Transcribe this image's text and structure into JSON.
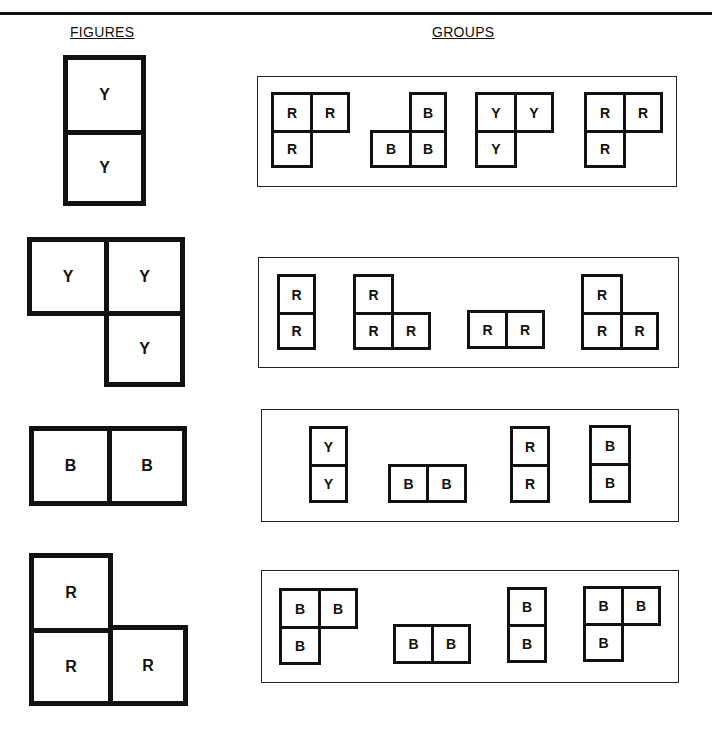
{
  "headings": {
    "figures": "FIGURES",
    "groups": "GROUPS"
  },
  "figures": [
    {
      "cells": [
        {
          "label": "Y",
          "x": 63,
          "y": 55,
          "w": 83,
          "h": 80
        },
        {
          "label": "Y",
          "x": 63,
          "y": 130,
          "w": 83,
          "h": 76
        }
      ]
    },
    {
      "cells": [
        {
          "label": "Y",
          "x": 27,
          "y": 237,
          "w": 82,
          "h": 79
        },
        {
          "label": "Y",
          "x": 104,
          "y": 237,
          "w": 81,
          "h": 79
        },
        {
          "label": "Y",
          "x": 104,
          "y": 311,
          "w": 81,
          "h": 76
        }
      ]
    },
    {
      "cells": [
        {
          "label": "B",
          "x": 29,
          "y": 426,
          "w": 83,
          "h": 80
        },
        {
          "label": "B",
          "x": 107,
          "y": 426,
          "w": 80,
          "h": 80
        }
      ]
    },
    {
      "cells": [
        {
          "label": "R",
          "x": 29,
          "y": 553,
          "w": 84,
          "h": 80
        },
        {
          "label": "R",
          "x": 29,
          "y": 628,
          "w": 84,
          "h": 78
        },
        {
          "label": "R",
          "x": 108,
          "y": 625,
          "w": 80,
          "h": 81
        }
      ]
    }
  ],
  "groups": [
    {
      "box": {
        "x": 257,
        "y": 76,
        "w": 420,
        "h": 111
      },
      "shapes": [
        {
          "cells": [
            {
              "label": "R",
              "x": 271,
              "y": 92,
              "w": 42,
              "h": 41
            },
            {
              "label": "R",
              "x": 310,
              "y": 92,
              "w": 40,
              "h": 41
            },
            {
              "label": "R",
              "x": 271,
              "y": 130,
              "w": 42,
              "h": 38
            }
          ]
        },
        {
          "cells": [
            {
              "label": "B",
              "x": 409,
              "y": 92,
              "w": 38,
              "h": 41
            },
            {
              "label": "B",
              "x": 370,
              "y": 130,
              "w": 42,
              "h": 38
            },
            {
              "label": "B",
              "x": 409,
              "y": 130,
              "w": 38,
              "h": 38
            }
          ]
        },
        {
          "cells": [
            {
              "label": "Y",
              "x": 475,
              "y": 92,
              "w": 42,
              "h": 41
            },
            {
              "label": "Y",
              "x": 514,
              "y": 92,
              "w": 40,
              "h": 41
            },
            {
              "label": "Y",
              "x": 475,
              "y": 130,
              "w": 42,
              "h": 38
            }
          ]
        },
        {
          "cells": [
            {
              "label": "R",
              "x": 584,
              "y": 92,
              "w": 42,
              "h": 41
            },
            {
              "label": "R",
              "x": 623,
              "y": 92,
              "w": 40,
              "h": 41
            },
            {
              "label": "R",
              "x": 584,
              "y": 130,
              "w": 42,
              "h": 38
            }
          ]
        }
      ]
    },
    {
      "box": {
        "x": 258,
        "y": 257,
        "w": 421,
        "h": 111
      },
      "shapes": [
        {
          "cells": [
            {
              "label": "R",
              "x": 277,
              "y": 274,
              "w": 39,
              "h": 41
            },
            {
              "label": "R",
              "x": 277,
              "y": 312,
              "w": 39,
              "h": 38
            }
          ]
        },
        {
          "cells": [
            {
              "label": "R",
              "x": 353,
              "y": 274,
              "w": 41,
              "h": 41
            },
            {
              "label": "R",
              "x": 353,
              "y": 312,
              "w": 41,
              "h": 38
            },
            {
              "label": "R",
              "x": 391,
              "y": 312,
              "w": 40,
              "h": 38
            }
          ]
        },
        {
          "cells": [
            {
              "label": "R",
              "x": 467,
              "y": 310,
              "w": 41,
              "h": 39
            },
            {
              "label": "R",
              "x": 505,
              "y": 310,
              "w": 40,
              "h": 39
            }
          ]
        },
        {
          "cells": [
            {
              "label": "R",
              "x": 581,
              "y": 274,
              "w": 42,
              "h": 41
            },
            {
              "label": "R",
              "x": 581,
              "y": 312,
              "w": 42,
              "h": 38
            },
            {
              "label": "R",
              "x": 620,
              "y": 312,
              "w": 39,
              "h": 38
            }
          ]
        }
      ]
    },
    {
      "box": {
        "x": 261,
        "y": 409,
        "w": 418,
        "h": 113
      },
      "shapes": [
        {
          "cells": [
            {
              "label": "Y",
              "x": 309,
              "y": 426,
              "w": 39,
              "h": 41
            },
            {
              "label": "Y",
              "x": 309,
              "y": 464,
              "w": 39,
              "h": 39
            }
          ]
        },
        {
          "cells": [
            {
              "label": "B",
              "x": 388,
              "y": 464,
              "w": 41,
              "h": 39
            },
            {
              "label": "B",
              "x": 426,
              "y": 464,
              "w": 41,
              "h": 39
            }
          ]
        },
        {
          "cells": [
            {
              "label": "R",
              "x": 510,
              "y": 426,
              "w": 40,
              "h": 41
            },
            {
              "label": "R",
              "x": 510,
              "y": 464,
              "w": 40,
              "h": 39
            }
          ]
        },
        {
          "cells": [
            {
              "label": "B",
              "x": 589,
              "y": 425,
              "w": 42,
              "h": 41
            },
            {
              "label": "B",
              "x": 589,
              "y": 463,
              "w": 42,
              "h": 40
            }
          ]
        }
      ]
    },
    {
      "box": {
        "x": 261,
        "y": 570,
        "w": 418,
        "h": 113
      },
      "shapes": [
        {
          "cells": [
            {
              "label": "B",
              "x": 279,
              "y": 588,
              "w": 42,
              "h": 41
            },
            {
              "label": "B",
              "x": 318,
              "y": 588,
              "w": 40,
              "h": 41
            },
            {
              "label": "B",
              "x": 279,
              "y": 626,
              "w": 42,
              "h": 39
            }
          ]
        },
        {
          "cells": [
            {
              "label": "B",
              "x": 393,
              "y": 624,
              "w": 41,
              "h": 40
            },
            {
              "label": "B",
              "x": 431,
              "y": 624,
              "w": 40,
              "h": 40
            }
          ]
        },
        {
          "cells": [
            {
              "label": "B",
              "x": 507,
              "y": 587,
              "w": 40,
              "h": 40
            },
            {
              "label": "B",
              "x": 507,
              "y": 624,
              "w": 40,
              "h": 39
            }
          ]
        },
        {
          "cells": [
            {
              "label": "B",
              "x": 583,
              "y": 586,
              "w": 41,
              "h": 40
            },
            {
              "label": "B",
              "x": 621,
              "y": 586,
              "w": 40,
              "h": 40
            },
            {
              "label": "B",
              "x": 583,
              "y": 623,
              "w": 41,
              "h": 39
            }
          ]
        }
      ]
    }
  ]
}
